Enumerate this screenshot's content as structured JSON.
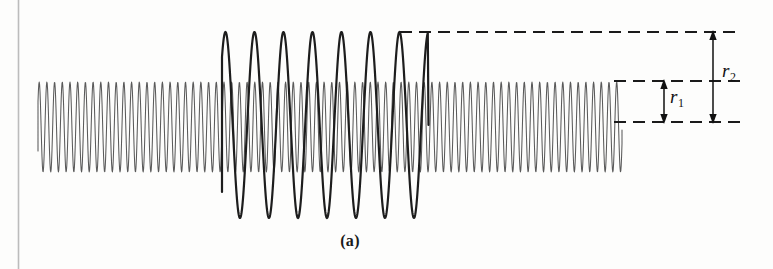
{
  "figure": {
    "caption": "(a)",
    "background_color": "#fdfdfc",
    "ink_color": "#1a1a1a",
    "carrier_color": "#555555",
    "page_edge_color": "#b9b9b9",
    "labels": {
      "r1": {
        "base": "r",
        "subscript": "1"
      },
      "r2": {
        "base": "r",
        "subscript": "2"
      }
    }
  },
  "chart_data": {
    "type": "line",
    "title": "(a)",
    "xlabel": "",
    "ylabel": "",
    "xlim": [
      38,
      740
    ],
    "ylim": [
      32,
      218
    ],
    "grid": false,
    "legend": null,
    "series": [
      {
        "name": "small-amplitude-wave",
        "color": "#555555",
        "x_start": 38,
        "x_end": 622,
        "center_y": 127,
        "amplitude": 45,
        "period_px": 7.7,
        "cycles": 76,
        "stroke_width": 1.0
      },
      {
        "name": "large-amplitude-wave",
        "color": "#1a1a1a",
        "x_start": 222,
        "x_end": 428,
        "center_y": 125,
        "amplitude": 93,
        "period_px": 29,
        "cycles": 7,
        "stroke_width": 2.2
      }
    ],
    "annotations": [
      {
        "name": "dashed-line-top",
        "type": "dashed-horizontal",
        "y": 32,
        "x_start": 400,
        "x_end": 740
      },
      {
        "name": "dashed-line-mid",
        "type": "dashed-horizontal",
        "y": 81,
        "x_start": 614,
        "x_end": 740
      },
      {
        "name": "dashed-line-bottom",
        "type": "dashed-horizontal",
        "y": 122,
        "x_start": 614,
        "x_end": 740
      },
      {
        "name": "arrow-r1",
        "type": "double-arrow-vertical",
        "x": 664,
        "y_top": 81,
        "y_bottom": 122,
        "label": "r1"
      },
      {
        "name": "arrow-r2",
        "type": "double-arrow-vertical",
        "x": 713,
        "y_top": 32,
        "y_bottom": 122,
        "label": "r2"
      },
      {
        "name": "page-edge-line",
        "type": "vertical-rule",
        "x": 18,
        "y_top": 0,
        "y_bottom": 269
      }
    ]
  }
}
